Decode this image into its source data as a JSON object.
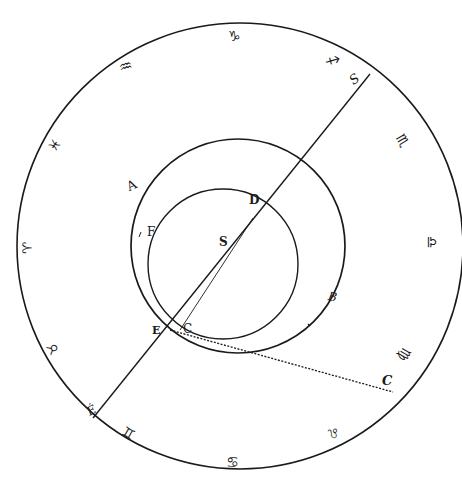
{
  "diagram": {
    "type": "astronomical-orbit-diagram",
    "colors": {
      "ink": "#1a1a1a",
      "background": "#ffffff"
    },
    "outer_circle": {
      "cx": 240,
      "cy": 246,
      "r": 223
    },
    "middle_circle": {
      "cx": 238,
      "cy": 246,
      "r": 107
    },
    "inner_circle": {
      "cx": 223,
      "cy": 264,
      "r": 75
    },
    "main_line": {
      "x1": 370,
      "y1": 74,
      "x2": 93,
      "y2": 418
    },
    "chord_line": {
      "x1": 253,
      "y1": 218,
      "x2": 180,
      "y2": 330
    },
    "dotted_line": {
      "x1": 170,
      "y1": 330,
      "x2": 393,
      "y2": 392
    },
    "labels": {
      "S_prime": "S",
      "A": "A",
      "B": "B",
      "D": "D",
      "F": "F",
      "S": "S",
      "E": "E",
      "C": "C",
      "E_prime": "É",
      "C_prime": "C"
    },
    "zodiac": {
      "capricorn": "♑",
      "aquarius": "♒",
      "pisces": "♓",
      "aries": "♈",
      "taurus": "♉",
      "gemini": "♊",
      "cancer": "♋",
      "leo": "♌",
      "virgo": "♍",
      "libra": "♎",
      "scorpio": "♏",
      "sagittarius": "♐"
    }
  }
}
